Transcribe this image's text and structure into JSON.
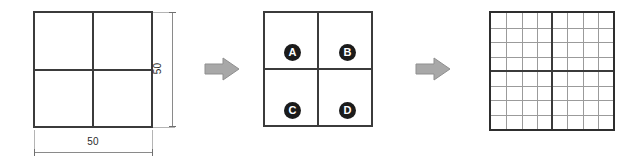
{
  "diagram": {
    "stages": [
      {
        "id": "coarse",
        "name": "dimensioned-quartered-square",
        "dimensions": {
          "width_label": "50",
          "height_label": "50"
        }
      },
      {
        "id": "labeled",
        "name": "labeled-quadrant-square",
        "quadrants": [
          {
            "key": "a",
            "label": "A",
            "position": "top-left"
          },
          {
            "key": "b",
            "label": "B",
            "position": "top-right"
          },
          {
            "key": "c",
            "label": "C",
            "position": "bottom-left"
          },
          {
            "key": "d",
            "label": "D",
            "position": "bottom-right"
          }
        ]
      },
      {
        "id": "fine",
        "name": "fine-mesh-square",
        "grid": {
          "columns": 8,
          "rows": 8
        }
      }
    ],
    "arrows": [
      {
        "id": "arrow-1",
        "direction": "right"
      },
      {
        "id": "arrow-2",
        "direction": "right"
      }
    ],
    "colors": {
      "outline": "#3b3b3b",
      "fine_line": "#9b9b9b",
      "arrow": "#a8a8a8",
      "label_fill": "#1b1b1b",
      "label_text": "#ffffff",
      "dimension_line": "#8a8a8a",
      "background": "#ffffff"
    }
  }
}
